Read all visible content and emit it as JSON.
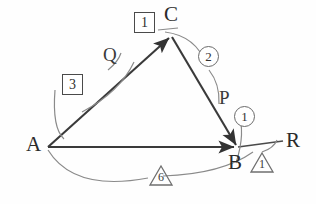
{
  "figure": {
    "background_color": "#fefefe",
    "edge_color": "#3a3a3a",
    "arc_color": "#7d7d7d"
  },
  "vertices": [
    {
      "id": "A",
      "label": "A",
      "x": 48,
      "y": 147
    },
    {
      "id": "C",
      "label": "C",
      "x": 172,
      "y": 35
    },
    {
      "id": "B",
      "label": "B",
      "x": 238,
      "y": 147
    }
  ],
  "points": [
    {
      "id": "P",
      "label": "P",
      "x": 224,
      "y": 100
    },
    {
      "id": "Q",
      "label": "Q",
      "x": 110,
      "y": 57
    },
    {
      "id": "R",
      "label": "R",
      "x": 288,
      "y": 143
    }
  ],
  "edges": [
    {
      "from": "A",
      "to": "C",
      "arrow": true
    },
    {
      "from": "C",
      "to": "B",
      "arrow": true
    },
    {
      "from": "A",
      "to": "B",
      "arrow": true
    },
    {
      "from": "B",
      "to": "R",
      "arrow": false
    }
  ],
  "boxed_numbers": [
    {
      "value": "1",
      "x": 134,
      "y": 23
    },
    {
      "value": "3",
      "x": 64,
      "y": 74
    }
  ],
  "circled_numbers": [
    {
      "value": "2",
      "x": 198,
      "y": 47
    },
    {
      "value": "1",
      "x": 235,
      "y": 107
    }
  ],
  "triangle_numbers": [
    {
      "value": "1",
      "x": 250,
      "y": 152
    },
    {
      "value": "6",
      "x": 150,
      "y": 168
    }
  ],
  "labels": {
    "vertex_a": "A",
    "vertex_b": "B",
    "vertex_c": "C",
    "point_p": "P",
    "point_q": "Q",
    "point_r": "R",
    "box_one": "1",
    "box_three": "3",
    "circle_one": "1",
    "circle_two": "2",
    "tri_one": "1",
    "tri_six": "6"
  }
}
